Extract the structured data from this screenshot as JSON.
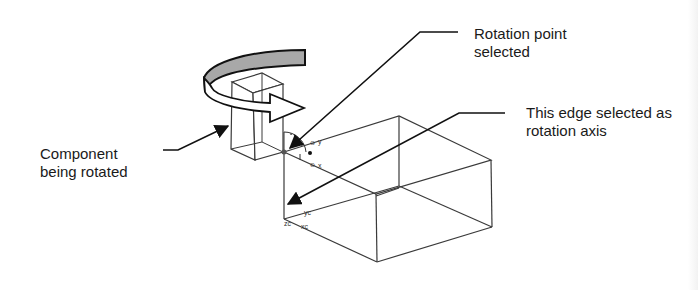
{
  "diagram": {
    "type": "cad-rotation-illustration",
    "callouts": {
      "rotation_point": {
        "line1": "Rotation point",
        "line2": "selected"
      },
      "rotation_axis": {
        "line1": "This edge selected as",
        "line2": "rotation axis"
      },
      "component": {
        "line1": "Component",
        "line2": "being rotated"
      }
    },
    "axis_labels": {
      "y_near": "y",
      "x_near": "x",
      "zc": "zc",
      "yc": "yc",
      "xc": "xc"
    },
    "colors": {
      "line": "#2a2a2a",
      "arrow_band_top": "#a8a8a8",
      "arrow_body": "#ffffff",
      "text": "#1a1a1a"
    }
  }
}
